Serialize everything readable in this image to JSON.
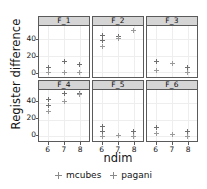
{
  "chart_data": {
    "type": "scatter",
    "title": "",
    "xlabel": "ndim",
    "ylabel": "Register difference",
    "xlim": [
      5.4,
      8.6
    ],
    "ylim": [
      -6,
      56
    ],
    "xticks": [
      6,
      7,
      8
    ],
    "xticklabels": [
      "6",
      "7",
      "8"
    ],
    "yticks": [
      0,
      20,
      40
    ],
    "yticklabels": [
      "0",
      "20",
      "40"
    ],
    "grid": true,
    "legend_position": "bottom",
    "facet_rows": 2,
    "facet_cols": 3,
    "legend": [
      {
        "name": "mcubes",
        "marker": "plus",
        "color": "#6f6f6f"
      },
      {
        "name": "pagani",
        "marker": "plus",
        "color": "#9a9a9a"
      }
    ],
    "panels": [
      {
        "label": "F_1",
        "series": [
          {
            "name": "mcubes",
            "points": [
              [
                6,
                5
              ],
              [
                6,
                0
              ],
              [
                7,
                13
              ],
              [
                7,
                0
              ],
              [
                8,
                9
              ],
              [
                8,
                0
              ]
            ]
          },
          {
            "name": "pagani",
            "points": [
              [
                6,
                0
              ],
              [
                7,
                0
              ],
              [
                8,
                0
              ]
            ]
          }
        ]
      },
      {
        "label": "F_2",
        "series": [
          {
            "name": "mcubes",
            "points": [
              [
                6,
                45
              ],
              [
                6,
                38
              ],
              [
                6,
                31
              ],
              [
                7,
                43
              ],
              [
                7,
                41
              ],
              [
                8,
                50
              ]
            ]
          },
          {
            "name": "pagani",
            "points": [
              [
                6,
                31
              ],
              [
                7,
                41
              ],
              [
                8,
                50
              ]
            ]
          }
        ]
      },
      {
        "label": "F_3",
        "series": [
          {
            "name": "mcubes",
            "points": [
              [
                6,
                13
              ],
              [
                6,
                2
              ],
              [
                7,
                10
              ],
              [
                8,
                6
              ],
              [
                8,
                0
              ]
            ]
          },
          {
            "name": "pagani",
            "points": [
              [
                6,
                2
              ],
              [
                7,
                10
              ],
              [
                8,
                0
              ]
            ]
          }
        ]
      },
      {
        "label": "F_4",
        "series": [
          {
            "name": "mcubes",
            "points": [
              [
                6,
                45
              ],
              [
                6,
                37
              ],
              [
                6,
                30
              ],
              [
                7,
                52
              ],
              [
                7,
                42
              ],
              [
                8,
                52
              ],
              [
                8,
                50
              ]
            ]
          },
          {
            "name": "pagani",
            "points": [
              [
                6,
                30
              ],
              [
                7,
                42
              ],
              [
                8,
                50
              ]
            ]
          }
        ]
      },
      {
        "label": "F_5",
        "series": [
          {
            "name": "mcubes",
            "points": [
              [
                6,
                12
              ],
              [
                6,
                5
              ],
              [
                6,
                0
              ],
              [
                7,
                1
              ],
              [
                8,
                6
              ],
              [
                8,
                0
              ]
            ]
          },
          {
            "name": "pagani",
            "points": [
              [
                6,
                0
              ],
              [
                7,
                1
              ],
              [
                8,
                0
              ]
            ]
          }
        ]
      },
      {
        "label": "F_6",
        "series": [
          {
            "name": "mcubes",
            "points": [
              [
                6,
                10
              ],
              [
                6,
                3
              ],
              [
                7,
                2
              ],
              [
                8,
                6
              ],
              [
                8,
                0
              ]
            ]
          },
          {
            "name": "pagani",
            "points": [
              [
                6,
                3
              ],
              [
                7,
                2
              ],
              [
                8,
                0
              ]
            ]
          }
        ]
      }
    ]
  }
}
